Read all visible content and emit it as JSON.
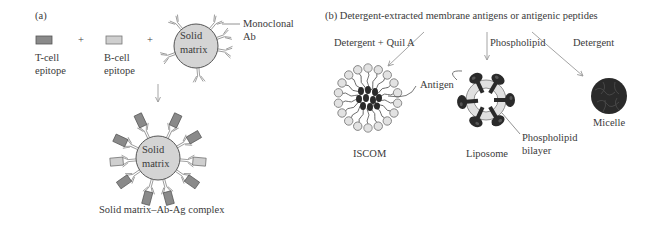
{
  "panel_a": {
    "tag": "(a)",
    "t_cell_label_line1": "T-cell",
    "t_cell_label_line2": "epitope",
    "b_cell_label_line1": "B-cell",
    "b_cell_label_line2": "epitope",
    "plus_1": "+",
    "plus_2": "+",
    "matrix_label_line1": "Solid",
    "matrix_label_line2": "matrix",
    "antibody_label_line1": "Monoclonal",
    "antibody_label_line2": "Ab",
    "complex_matrix_line1": "Solid",
    "complex_matrix_line2": "matrix",
    "complex_caption": "Solid matrix–Ab-Ag complex"
  },
  "panel_b": {
    "title": "(b)  Detergent-extracted membrane antigens or antigenic peptides",
    "arrow_left_label": "Detergent + Quil A",
    "arrow_middle_label": "Phospholipid",
    "arrow_right_label": "Detergent",
    "antigen_label": "Antigen",
    "iscom_label": "ISCOM",
    "liposome_label": "Liposome",
    "bilayer_label_line1": "Phospholipid",
    "bilayer_label_line2": "bilayer",
    "micelle_label": "Micelle"
  },
  "colors": {
    "t_cell_epitope": "#8a8a8a",
    "b_cell_epitope": "#cfcfcf",
    "matrix_fill": "#d4d4d4",
    "dark_antigen": "#2a2a2a",
    "arrow": "#9a9a9a"
  }
}
